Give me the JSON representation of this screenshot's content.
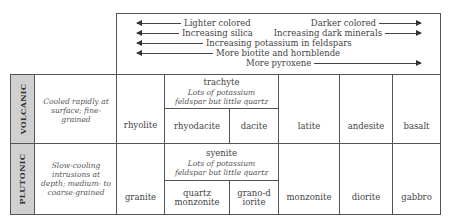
{
  "header": {
    "arrows": [
      {
        "left_label": "Lighter colored",
        "right_label": "Darker colored"
      },
      {
        "left_label": "Increasing silica",
        "right_label": "Increasing dark minerals"
      },
      {
        "left_label": "Increasing potassium in feldspars",
        "direction": "left"
      },
      {
        "left_label": "More biotite and hornblende",
        "direction": "left"
      },
      {
        "right_label": "More pyroxene",
        "direction": "right"
      }
    ]
  },
  "rows": {
    "volcanic": {
      "label": "VOLCANIC",
      "description": "Cooled rapidly at surface; fine-grained",
      "col1": "rhyolite",
      "group_name": "trachyte",
      "group_note": "Lots of potassium feldspar but little quartz",
      "sub1": "rhyodacite",
      "sub2": "dacite",
      "col3": "latite",
      "col4": "andesite",
      "col5": "basalt"
    },
    "plutonic": {
      "label": "PLUTONIC",
      "description": "Slow-cooling intrusions at depth; medium- to coarse-grained",
      "col1": "granite",
      "group_name": "syenite",
      "group_note": "Lots of potassium feldspar but little quartz",
      "sub1": "quartz monzonite",
      "sub2": "grano-diorite",
      "col3": "monzonite",
      "col4": "diorite",
      "col5": "gabbro"
    }
  }
}
